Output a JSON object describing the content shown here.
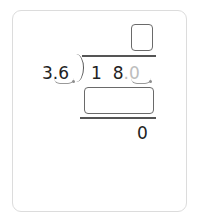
{
  "problem": {
    "divisor": "3.6",
    "divisor_parts": {
      "whole": "3",
      "point": ".",
      "frac": "6"
    },
    "dividend_parts": {
      "d1": "1",
      "d2": "8",
      "point": ".",
      "d3": "0"
    },
    "quotient_placeholder": "",
    "product_placeholder": "",
    "remainder": "0"
  },
  "colors": {
    "stroke": "#555555",
    "ghost_digit": "#bdbdbd",
    "card_border": "#dcdcdc"
  }
}
